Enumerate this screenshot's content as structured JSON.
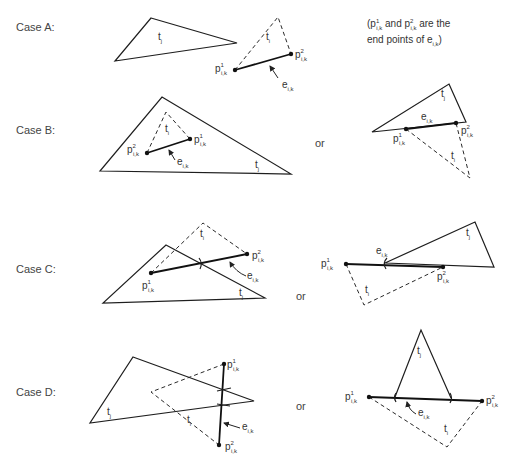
{
  "cases": [
    {
      "id": "A",
      "label": "Case A:"
    },
    {
      "id": "B",
      "label": "Case B:"
    },
    {
      "id": "C",
      "label": "Case C:"
    },
    {
      "id": "D",
      "label": "Case D:"
    }
  ],
  "or_label": "or",
  "note": {
    "line1_prefix": "(p",
    "line1_mid": " and p",
    "line1_suffix": " are the",
    "line2": "end points of e",
    "line2_end": ")"
  },
  "symbols": {
    "t": "t",
    "t_i_sub": "i",
    "t_j_sub": "j",
    "p": "p",
    "e": "e",
    "sup1": "1",
    "sup2": "2",
    "ik": "i,k"
  }
}
